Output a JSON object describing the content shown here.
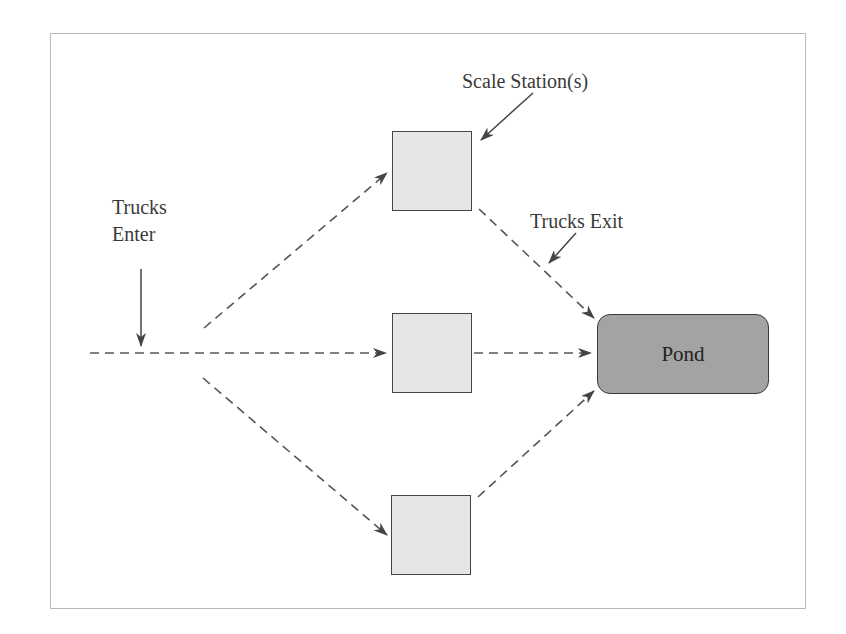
{
  "diagram": {
    "labels": {
      "scale_stations": "Scale Station(s)",
      "trucks_enter_line1": "Trucks",
      "trucks_enter_line2": "Enter",
      "trucks_exit": "Trucks Exit",
      "pond": "Pond"
    },
    "nodes": [
      {
        "id": "scale-station-top",
        "type": "scale-station"
      },
      {
        "id": "scale-station-middle",
        "type": "scale-station"
      },
      {
        "id": "scale-station-bottom",
        "type": "scale-station"
      },
      {
        "id": "pond",
        "type": "destination",
        "label": "Pond"
      }
    ],
    "edges": [
      {
        "from": "entry",
        "to": "scale-station-top",
        "style": "dashed"
      },
      {
        "from": "entry",
        "to": "scale-station-middle",
        "style": "dashed"
      },
      {
        "from": "entry",
        "to": "scale-station-bottom",
        "style": "dashed"
      },
      {
        "from": "scale-station-top",
        "to": "pond",
        "style": "dashed"
      },
      {
        "from": "scale-station-middle",
        "to": "pond",
        "style": "dashed"
      },
      {
        "from": "scale-station-bottom",
        "to": "pond",
        "style": "dashed"
      }
    ],
    "colors": {
      "station_fill": "#e6e6e6",
      "pond_fill": "#a3a3a3",
      "line": "#555555",
      "frame": "#b9b9b9"
    }
  }
}
